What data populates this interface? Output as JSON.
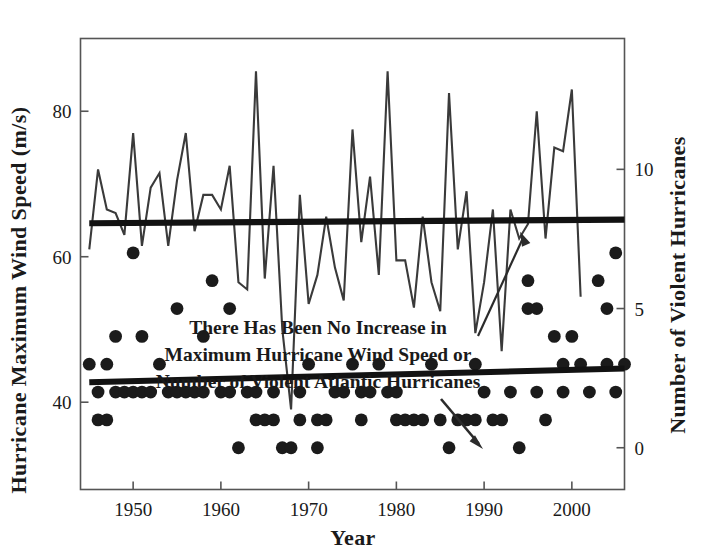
{
  "figure": {
    "background_color": "#ffffff",
    "ink_color": "#1f1f1f",
    "frame_color": "#4a4a4a"
  },
  "chart_data": {
    "type": "line",
    "title": "",
    "subtitle": "",
    "xlabel": "Year",
    "ylabel": "Hurricane Maximum Wind Speed (m/s)",
    "y2label": "Number of Violent Hurricanes",
    "xlim": [
      1944,
      2006
    ],
    "ylim": [
      28,
      90
    ],
    "y2lim": [
      -1.5,
      14.7
    ],
    "xticks": [
      1950,
      1960,
      1970,
      1980,
      1990,
      2000
    ],
    "xticklabels": [
      "1950",
      "1960",
      "1970",
      "1980",
      "1990",
      "2000"
    ],
    "yticks": [
      40,
      60,
      80
    ],
    "yticklabels": [
      "40",
      "60",
      "80"
    ],
    "y2ticks": [
      0,
      5,
      10
    ],
    "y2ticklabels": [
      "0",
      "5",
      "10"
    ],
    "grid": false,
    "legend": "none",
    "annotations": [
      {
        "name": "no-increase-note",
        "text_lines": [
          "There Has Been No Increase in",
          "Maximum Hurricane Wind Speed or",
          "Number of Violent Atlantic Hurricanes"
        ],
        "arrow_up_to": "wind-speed-line",
        "arrow_down_to": "violent-hurricane-scatter"
      }
    ],
    "series": [
      {
        "name": "Hurricane Maximum Wind Speed",
        "axis": "left",
        "type": "line",
        "x": [
          1945,
          1946,
          1947,
          1948,
          1949,
          1950,
          1951,
          1952,
          1953,
          1954,
          1955,
          1956,
          1957,
          1958,
          1959,
          1960,
          1961,
          1962,
          1963,
          1964,
          1965,
          1966,
          1967,
          1968,
          1969,
          1970,
          1971,
          1972,
          1973,
          1974,
          1975,
          1976,
          1977,
          1978,
          1979,
          1980,
          1981,
          1982,
          1983,
          1984,
          1985,
          1986,
          1987,
          1988,
          1989,
          1990,
          1991,
          1992,
          1993,
          1994,
          1995,
          1996,
          1997,
          1998,
          1999,
          2000,
          2001,
          2002,
          2003,
          2004,
          2005,
          2006
        ],
        "values": [
          61.0,
          72.0,
          66.5,
          66.0,
          63.0,
          77.0,
          61.5,
          69.5,
          71.5,
          61.5,
          70.5,
          77.0,
          63.5,
          68.5,
          68.5,
          66.5,
          72.5,
          56.5,
          55.5,
          85.5,
          57.0,
          72.5,
          50.0,
          39.0,
          68.5,
          53.5,
          57.5,
          65.5,
          58.5,
          54.0,
          77.5,
          62.0,
          71.0,
          57.5,
          85.5,
          59.5,
          59.5,
          53.0,
          65.5,
          56.5,
          52.5,
          82.5,
          61.0,
          69.0,
          49.5,
          56.5,
          66.5,
          47.0,
          66.5,
          62.5,
          64.5,
          80.0,
          62.5,
          75.0,
          74.5,
          83.0,
          54.5,
          null,
          null,
          null,
          null,
          null
        ]
      },
      {
        "name": "Wind Speed Trend",
        "axis": "left",
        "type": "trend",
        "x": [
          1945,
          2006
        ],
        "values": [
          64.6,
          65.1
        ]
      },
      {
        "name": "Number of Violent Hurricanes",
        "axis": "right",
        "type": "scatter",
        "x": [
          1945,
          1946,
          1946,
          1947,
          1947,
          1948,
          1948,
          1949,
          1950,
          1950,
          1951,
          1951,
          1952,
          1953,
          1954,
          1955,
          1955,
          1956,
          1957,
          1958,
          1958,
          1959,
          1960,
          1961,
          1961,
          1962,
          1963,
          1964,
          1964,
          1965,
          1966,
          1966,
          1967,
          1968,
          1969,
          1969,
          1970,
          1971,
          1971,
          1972,
          1973,
          1974,
          1975,
          1976,
          1976,
          1977,
          1978,
          1979,
          1980,
          1980,
          1981,
          1982,
          1983,
          1984,
          1985,
          1986,
          1987,
          1988,
          1989,
          1989,
          1990,
          1991,
          1992,
          1993,
          1994,
          1995,
          1995,
          1996,
          1996,
          1997,
          1998,
          1999,
          1999,
          2000,
          2001,
          2002,
          2003,
          2004,
          2004,
          2005,
          2005,
          2006
        ],
        "values": [
          3,
          2,
          1,
          1,
          3,
          2,
          4,
          2,
          7,
          2,
          4,
          2,
          2,
          3,
          2,
          5,
          2,
          2,
          2,
          4,
          2,
          6,
          2,
          5,
          2,
          0,
          2,
          2,
          1,
          1,
          1,
          2,
          0,
          0,
          1,
          2,
          3,
          1,
          0,
          1,
          2,
          2,
          3,
          2,
          1,
          2,
          3,
          2,
          2,
          1,
          1,
          1,
          1,
          3,
          1,
          0,
          1,
          1,
          1,
          3,
          2,
          1,
          1,
          2,
          0,
          5,
          6,
          5,
          2,
          1,
          4,
          3,
          2,
          4,
          3,
          2,
          6,
          5,
          3,
          7,
          2,
          3
        ]
      },
      {
        "name": "Violent Hurricane Trend",
        "axis": "right",
        "type": "trend",
        "x": [
          1945,
          2006
        ],
        "values": [
          2.35,
          2.85
        ]
      }
    ]
  },
  "axes": {
    "left_title": "Hurricane Maximum Wind Speed (m/s)",
    "right_title": "Number of Violent Hurricanes",
    "bottom_title": "Year"
  }
}
